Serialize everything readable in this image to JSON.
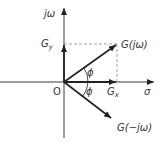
{
  "diagram": {
    "title": "",
    "colors": {
      "line": "#222222",
      "dashed": "#888888",
      "text": "#333333",
      "background": "#ffffff"
    },
    "axes": {
      "vertical_label": "jω",
      "horizontal_label": "σ",
      "origin_label": "O"
    },
    "vectors": [
      {
        "id": "g-jw",
        "label": "G(jω)"
      },
      {
        "id": "g-neg-jw",
        "label": "G(−jω)"
      },
      {
        "id": "gx",
        "label": "Gx",
        "base": "G",
        "sub": "x"
      },
      {
        "id": "gy",
        "label": "Gy",
        "base": "G",
        "sub": "y"
      }
    ],
    "angles": [
      {
        "id": "phi-upper",
        "label": "ϕ"
      },
      {
        "id": "phi-lower",
        "label": "ϕ"
      }
    ]
  }
}
